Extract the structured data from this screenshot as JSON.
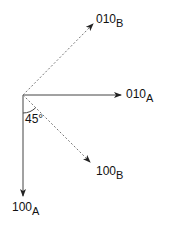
{
  "diagram": {
    "type": "vector-diagram",
    "origin": {
      "x": 23,
      "y": 95
    },
    "angle_label": "45°",
    "colors": {
      "solid": "#444444",
      "dotted": "#777777",
      "text": "#111111"
    },
    "vectors": [
      {
        "id": "010A",
        "style": "solid",
        "base": "010",
        "sub": "A",
        "end": {
          "x": 121,
          "y": 95
        }
      },
      {
        "id": "100A",
        "style": "solid",
        "base": "100",
        "sub": "A",
        "end": {
          "x": 23,
          "y": 195
        }
      },
      {
        "id": "010B",
        "style": "dotted",
        "base": "010",
        "sub": "B",
        "end": {
          "x": 93,
          "y": 24
        }
      },
      {
        "id": "100B",
        "style": "dotted",
        "base": "100",
        "sub": "B",
        "end": {
          "x": 90,
          "y": 162
        }
      }
    ]
  }
}
